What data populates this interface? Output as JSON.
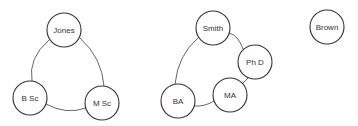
{
  "diagram": {
    "groups": [
      {
        "name": "jones-group",
        "nodes": [
          {
            "id": "jones",
            "label": "Jones",
            "cx": 64,
            "cy": 30
          },
          {
            "id": "bsc",
            "label": "B Sc",
            "cx": 30,
            "cy": 98
          },
          {
            "id": "msc",
            "label": "M Sc",
            "cx": 102,
            "cy": 103
          }
        ],
        "edges": [
          {
            "from": "jones",
            "to": "bsc"
          },
          {
            "from": "jones",
            "to": "msc"
          },
          {
            "from": "bsc",
            "to": "msc"
          }
        ]
      },
      {
        "name": "smith-group",
        "nodes": [
          {
            "id": "smith",
            "label": "Smith",
            "cx": 213,
            "cy": 28
          },
          {
            "id": "phd",
            "label": "Ph D",
            "cx": 255,
            "cy": 62
          },
          {
            "id": "ma",
            "label": "MA",
            "cx": 230,
            "cy": 95
          },
          {
            "id": "ba",
            "label": "BA",
            "cx": 178,
            "cy": 101
          }
        ],
        "edges": [
          {
            "from": "smith",
            "to": "phd"
          },
          {
            "from": "phd",
            "to": "ma"
          },
          {
            "from": "ma",
            "to": "ba"
          },
          {
            "from": "ba",
            "to": "smith"
          }
        ]
      },
      {
        "name": "brown-group",
        "nodes": [
          {
            "id": "brown",
            "label": "Brown",
            "cx": 327,
            "cy": 27
          }
        ],
        "edges": []
      }
    ],
    "node_radius": 17
  }
}
